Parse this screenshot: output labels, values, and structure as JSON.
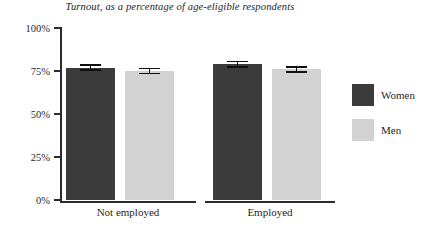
{
  "chart_data": {
    "type": "bar",
    "title": "Turnout, as a percentage of age-eligible respondents",
    "xlabel": "",
    "ylabel": "",
    "ylim": [
      0,
      100
    ],
    "yticks": [
      0,
      25,
      50,
      75,
      100
    ],
    "ytick_labels": [
      "0%",
      "25%",
      "50%",
      "75%",
      "100%"
    ],
    "grid": false,
    "legend_position": "right",
    "categories": [
      "Not employed",
      "Employed"
    ],
    "series": [
      {
        "name": "Women",
        "color": "#3b3b3b",
        "values": [
          77,
          79
        ],
        "errors": [
          2.0,
          2.0
        ]
      },
      {
        "name": "Men",
        "color": "#d2d2d2",
        "values": [
          75,
          76
        ],
        "errors": [
          2.0,
          2.0
        ]
      }
    ]
  },
  "title": {
    "text": "Turnout, as a percentage of age-eligible respondents"
  },
  "axes": {
    "y": {
      "ticks": [
        {
          "label": "100%",
          "value": 100
        },
        {
          "label": "75%",
          "value": 75
        },
        {
          "label": "50%",
          "value": 50
        },
        {
          "label": "25%",
          "value": 25
        },
        {
          "label": "0%",
          "value": 0
        }
      ]
    },
    "x": {
      "groups": [
        {
          "label": "Not employed"
        },
        {
          "label": "Employed"
        }
      ]
    }
  },
  "legend": {
    "entries": [
      {
        "label": "Women",
        "color": "#3b3b3b"
      },
      {
        "label": "Men",
        "color": "#d2d2d2"
      }
    ]
  }
}
